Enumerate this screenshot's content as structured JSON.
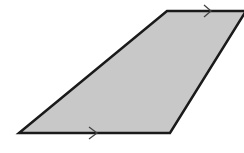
{
  "diagram": {
    "shape": "quadrilateral",
    "fill_color": "#c8c8c8",
    "stroke_color": "#1a1a1a",
    "arrow_color": "#444444",
    "vertices": [
      [
        167,
        11
      ],
      [
        246,
        11
      ],
      [
        170,
        133
      ],
      [
        19,
        133
      ]
    ],
    "parallel_marks": [
      {
        "side": "top",
        "position": [
          210,
          11
        ],
        "direction": "right"
      },
      {
        "side": "bottom",
        "position": [
          95,
          133
        ],
        "direction": "right"
      }
    ]
  }
}
